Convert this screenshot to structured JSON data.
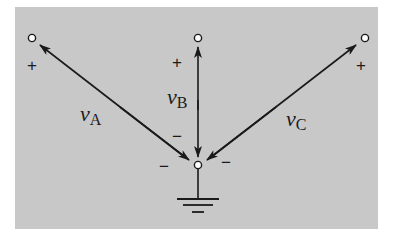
{
  "diagram": {
    "background": "#c8c8c8",
    "stroke": "#1a1a1a",
    "nodes": {
      "a": {
        "x": 32,
        "y": 38
      },
      "b": {
        "x": 198,
        "y": 38
      },
      "c": {
        "x": 365,
        "y": 38
      },
      "ref": {
        "x": 198,
        "y": 165
      }
    },
    "voltages": [
      {
        "name": "vA",
        "symbol": "v",
        "subscript": "A",
        "plus": "+",
        "minus": "−"
      },
      {
        "name": "vB",
        "symbol": "v",
        "subscript": "B",
        "plus": "+",
        "minus": "−"
      },
      {
        "name": "vC",
        "symbol": "v",
        "subscript": "C",
        "plus": "+",
        "minus": "−"
      }
    ],
    "ground": "ground-symbol"
  }
}
